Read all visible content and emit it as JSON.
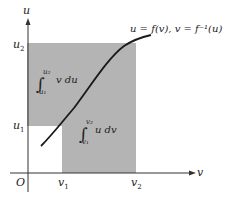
{
  "figure": {
    "colors": {
      "shade": "#b4b4b4",
      "curve": "#1a1a1a",
      "axis": "#333333",
      "text": "#222222"
    },
    "axes": {
      "vertical_label": "u",
      "horizontal_label": "v",
      "origin_label": "O"
    },
    "ticks": {
      "u1": {
        "base": "u",
        "sub": "1"
      },
      "u2": {
        "base": "u",
        "sub": "2"
      },
      "v1": {
        "base": "v",
        "sub": "1"
      },
      "v2": {
        "base": "v",
        "sub": "2"
      }
    },
    "curve_label": "u = f(v),  v = f⁻¹(u)",
    "integral_upper": {
      "sign": "∫",
      "lower": "u₁",
      "upper": "u₂",
      "integrand": "v  du"
    },
    "integral_lower": {
      "sign": "∫",
      "lower": "v₁",
      "upper": "v₂",
      "integrand": "u  dv"
    }
  }
}
